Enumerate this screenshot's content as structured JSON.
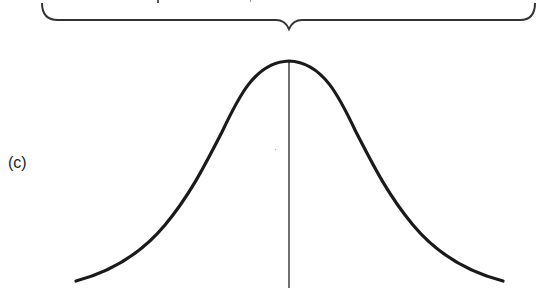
{
  "figure": {
    "panel_label": "(c)",
    "stroke_color": "#1a1a1a",
    "brace": {
      "x_start": 42,
      "x_end": 535,
      "y": 20,
      "tip_x": 289,
      "tip_y": 29
    },
    "curve": {
      "peak_x": 289,
      "peak_y": 61,
      "left_end_x": 76,
      "right_end_x": 503,
      "end_y": 281
    },
    "center_line": {
      "x": 289,
      "y_top": 61,
      "y_bottom": 288
    }
  }
}
